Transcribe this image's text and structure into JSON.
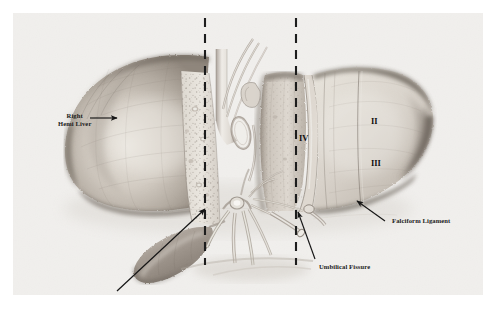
{
  "figure": {
    "kind": "anatomical-illustration",
    "medium": "graphite-pencil-drawing",
    "plate_background": "#f4f3f1",
    "ink_color": "#1b1b1b"
  },
  "labels": {
    "right_hemi_liver": "Right\nHemi Liver",
    "right_hemi_liver_line1": "Right",
    "right_hemi_liver_line2": "Hemi Liver",
    "falciform_ligament": "Falciform Ligament",
    "umbilical_fissure": "Umbilical Fissure",
    "principle_plane": "Principle Plane"
  },
  "segments": [
    {
      "numeral": "II",
      "name": "segment-two"
    },
    {
      "numeral": "III",
      "name": "segment-three"
    },
    {
      "numeral": "IV",
      "name": "segment-four"
    }
  ],
  "segment_labels": {
    "ii": "II",
    "iii": "III",
    "iv": "IV"
  },
  "planes": [
    {
      "name": "principal-plane",
      "style": "dashed-vertical",
      "x": 192,
      "color": "#1d1d1d"
    },
    {
      "name": "umbilical-fissure-plane",
      "style": "dashed-vertical",
      "x": 283,
      "color": "#1d1d1d"
    }
  ],
  "structures": [
    {
      "name": "right-hemi-liver",
      "tone": "#b3aca4"
    },
    {
      "name": "left-lateral-segment",
      "tone": "#c9c3bb"
    },
    {
      "name": "segment-four",
      "tone": "#bdb6ad"
    },
    {
      "name": "cut-surface-stippled",
      "tone": "#e3dfd8"
    },
    {
      "name": "gallbladder",
      "tone": "#a89f96"
    },
    {
      "name": "portal-vein-branches",
      "tone": "#ddd8d0"
    },
    {
      "name": "hepatic-artery-branches",
      "tone": "#d6d1c8"
    },
    {
      "name": "bile-duct",
      "tone": "#e0dbd3"
    },
    {
      "name": "inferior-vena-cava",
      "tone": "#cdc7bf"
    },
    {
      "name": "hepatic-veins",
      "tone": "#d9d4cc"
    }
  ]
}
